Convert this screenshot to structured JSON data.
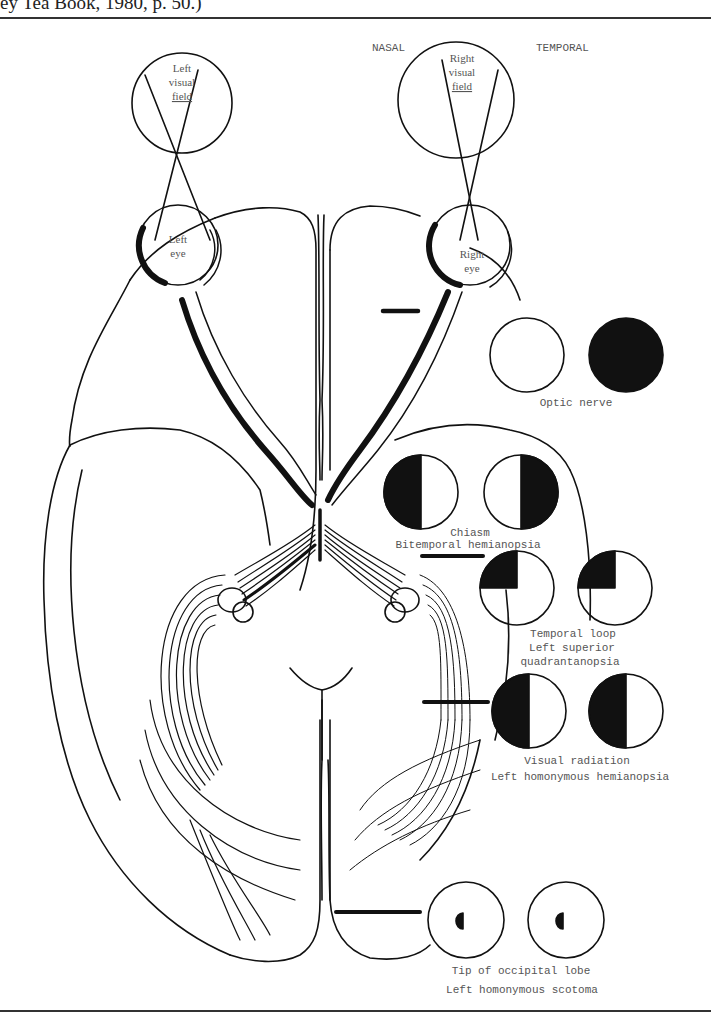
{
  "caption_fragment": "ey Tea Book, 1980, p. 50.)",
  "orientation": {
    "nasal": "NASAL",
    "temporal": "TEMPORAL"
  },
  "visual_fields": {
    "left": [
      "Left",
      "visual",
      "field"
    ],
    "right": [
      "Right",
      "visual",
      "field"
    ]
  },
  "eyes": {
    "left": [
      "Left",
      "eye"
    ],
    "right": [
      "Right",
      "eye"
    ]
  },
  "lesions": [
    {
      "site": "Optic nerve",
      "deficit": "",
      "left_field": "clear",
      "right_field": "full-black"
    },
    {
      "site": "Chiasm",
      "deficit": "Bitemporal hemianopsia",
      "left_field": "left-half-black",
      "right_field": "right-half-black"
    },
    {
      "site": "Temporal loop",
      "deficit_line1": "Left superior",
      "deficit_line2": "quadrantanopsia",
      "left_field": "upper-left-quadrant-black",
      "right_field": "upper-left-quadrant-black"
    },
    {
      "site": "Visual radiation",
      "deficit": "Left homonymous hemianopsia",
      "left_field": "left-half-black",
      "right_field": "left-half-black"
    },
    {
      "site": "Tip of occipital lobe",
      "deficit": "Left homonymous scotoma",
      "left_field": "small-left-central-scotoma",
      "right_field": "small-left-central-scotoma"
    }
  ],
  "colors": {
    "ink": "#111111",
    "label": "#555555",
    "paper": "#ffffff"
  }
}
